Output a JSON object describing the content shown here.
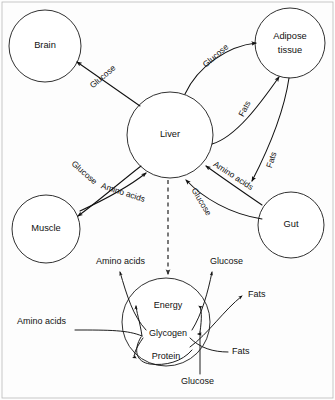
{
  "diagram": {
    "type": "biological-flow-diagram",
    "background_color": "#fdfdfd",
    "stroke_color": "#111111",
    "nodes": [
      {
        "id": "brain",
        "label": "Brain",
        "cx": 45,
        "cy": 46,
        "r": 36
      },
      {
        "id": "adipose",
        "label_line1": "Adipose",
        "label_line2": "tissue",
        "cx": 290,
        "cy": 43,
        "r": 35
      },
      {
        "id": "liver",
        "label": "Liver",
        "cx": 170,
        "cy": 135,
        "r": 43
      },
      {
        "id": "muscle",
        "label": "Muscle",
        "cx": 46,
        "cy": 229,
        "r": 34
      },
      {
        "id": "gut",
        "label": "Gut",
        "cx": 291,
        "cy": 225,
        "r": 33
      },
      {
        "id": "cell",
        "label": "",
        "cx": 166,
        "cy": 322,
        "r": 44
      }
    ],
    "flows": [
      {
        "id": "liver-to-brain",
        "label": "Glucose",
        "from": "liver",
        "to": "brain",
        "label_x": 103,
        "label_y": 77,
        "rotate": -40
      },
      {
        "id": "liver-to-adipose",
        "label": "Glucose",
        "from": "liver",
        "to": "adipose",
        "label_x": 216,
        "label_y": 56,
        "rotate": -41
      },
      {
        "id": "liver-to-adipose-2",
        "label": "Fats",
        "from": "liver",
        "to": "adipose",
        "label_x": 245,
        "label_y": 109,
        "rotate": -62
      },
      {
        "id": "gut-to-adipose",
        "label": "Fats",
        "from": "gut",
        "to": "adipose",
        "label_x": 272,
        "label_y": 160,
        "rotate": -72
      },
      {
        "id": "liver-to-muscle",
        "label": "Glucose",
        "from": "liver",
        "to": "muscle",
        "label_x": 84,
        "label_y": 173,
        "rotate": 41
      },
      {
        "id": "muscle-to-liver",
        "label": "Amino acids",
        "from": "muscle",
        "to": "liver",
        "label_x": 123,
        "label_y": 191,
        "rotate": 18
      },
      {
        "id": "gut-to-liver-aa",
        "label": "Amino acids",
        "from": "gut",
        "to": "liver",
        "label_x": 233,
        "label_y": 175,
        "rotate": 33
      },
      {
        "id": "gut-to-liver-glc",
        "label": "Glucose",
        "from": "gut",
        "to": "liver",
        "label_x": 200,
        "label_y": 200,
        "rotate": 59
      }
    ],
    "cell_internal": [
      {
        "id": "energy",
        "label": "Energy",
        "x": 168,
        "y": 306
      },
      {
        "id": "glycogen",
        "label": "Glycogen",
        "x": 168,
        "y": 334
      },
      {
        "id": "protein",
        "label": "Protein",
        "x": 166,
        "y": 355
      }
    ],
    "cell_io": [
      {
        "id": "out-amino-acids",
        "label": "Amino acids",
        "x": 96,
        "y": 262,
        "anchor": "start",
        "direction": "out"
      },
      {
        "id": "out-glucose",
        "label": "Glucose",
        "x": 210,
        "y": 262,
        "anchor": "start",
        "direction": "out"
      },
      {
        "id": "out-fats",
        "label": "Fats",
        "x": 246,
        "y": 297,
        "anchor": "start",
        "direction": "out"
      },
      {
        "id": "in-amino-acids",
        "label": "Amino acids",
        "x": 18,
        "y": 322,
        "anchor": "start",
        "direction": "in"
      },
      {
        "id": "in-fats",
        "label": "Fats",
        "x": 230,
        "y": 352,
        "anchor": "start",
        "direction": "in"
      },
      {
        "id": "in-glucose",
        "label": "Glucose",
        "x": 183,
        "y": 381,
        "anchor": "start",
        "direction": "in"
      }
    ]
  }
}
